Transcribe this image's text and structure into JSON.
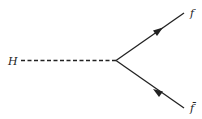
{
  "diagram": {
    "type": "feynman",
    "labels": {
      "higgs": "H",
      "fermion": "f",
      "antifermion": "f̄"
    },
    "colors": {
      "line": "#222222",
      "background": "#ffffff"
    }
  }
}
